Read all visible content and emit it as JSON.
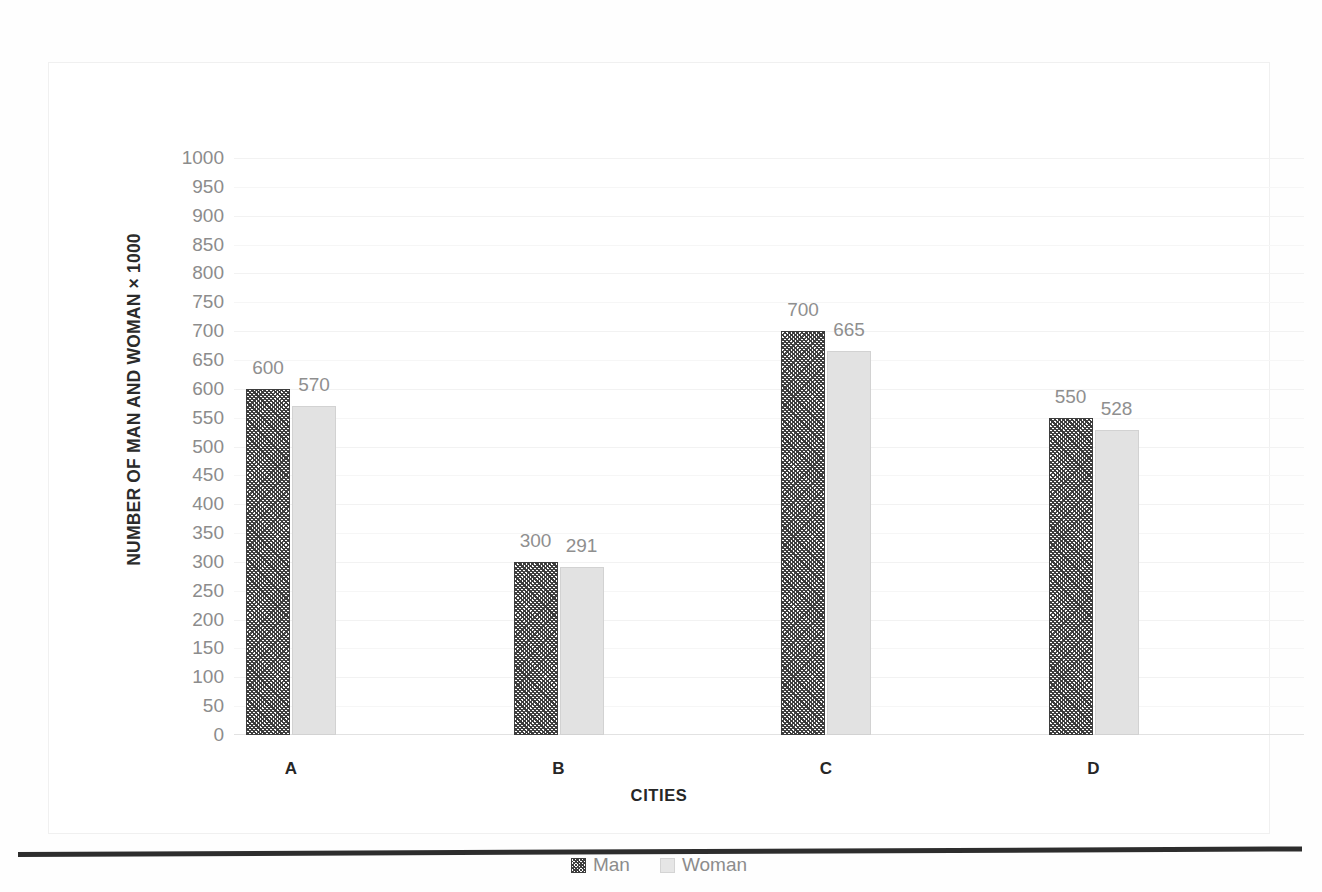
{
  "chart_data": {
    "type": "bar",
    "title": "",
    "xlabel": "CITIES",
    "ylabel": "NUMBER OF MAN AND WOMAN × 1000",
    "categories": [
      "A",
      "B",
      "C",
      "D"
    ],
    "series": [
      {
        "name": "Man",
        "values": [
          600,
          300,
          700,
          550
        ]
      },
      {
        "name": "Woman",
        "values": [
          570,
          291,
          665,
          528
        ]
      }
    ],
    "ylim": [
      0,
      1000
    ],
    "ytick_step": 50,
    "yticks": [
      0,
      50,
      100,
      150,
      200,
      250,
      300,
      350,
      400,
      450,
      500,
      550,
      600,
      650,
      700,
      750,
      800,
      850,
      900,
      950,
      1000
    ],
    "ytick_labels": [
      "0",
      "50",
      "100",
      "150",
      "200",
      "250",
      "300",
      "350",
      "400",
      "450",
      "500",
      "550",
      "600",
      "650",
      "700",
      "750",
      "800",
      "850",
      "900",
      "950",
      "1000"
    ],
    "grid": true,
    "legend_position": "bottom",
    "data_labels": {
      "Man": [
        "600",
        "300",
        "700",
        "550"
      ],
      "Woman": [
        "570",
        "291",
        "665",
        "528"
      ]
    },
    "colors": {
      "man_fill": "#4a4a4a",
      "man_border": "#3d3d3d",
      "woman_fill": "#e2e2e2",
      "woman_border": "#d2d2d2",
      "gridline": "#f2f2f2",
      "tick_text": "#8c8c8c",
      "data_label_text": "#8f8f8f",
      "axis_title_text": "#262626"
    }
  },
  "legend": {
    "items": [
      {
        "label": "Man",
        "swatch": "man-pattern-swatch"
      },
      {
        "label": "Woman",
        "swatch": "woman-solid-swatch"
      }
    ]
  }
}
